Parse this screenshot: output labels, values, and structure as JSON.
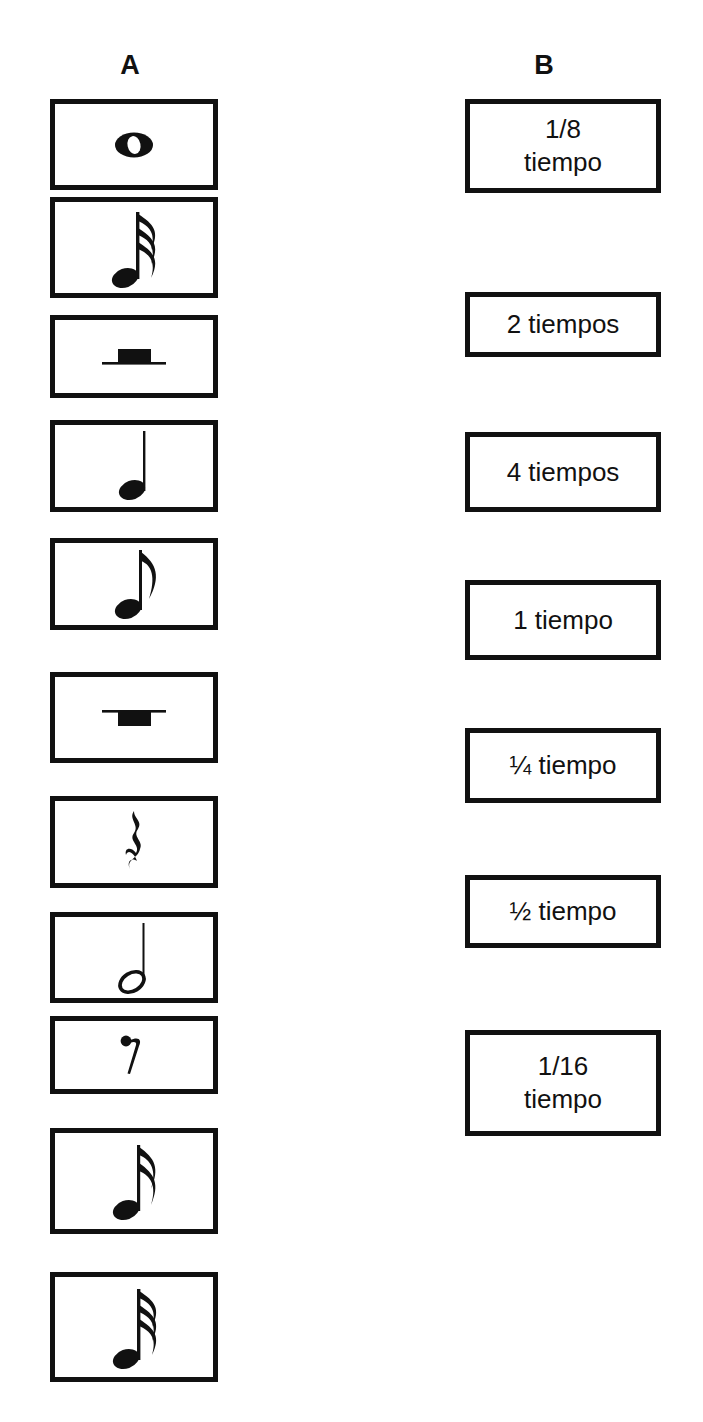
{
  "page": {
    "background_color": "#ffffff",
    "ink_color": "#111111",
    "width": 703,
    "height": 1422
  },
  "columns": {
    "a": {
      "header": "A",
      "kind": "music-symbol-cards"
    },
    "b": {
      "header": "B",
      "kind": "duration-label-cards"
    }
  },
  "column_a": {
    "items": [
      {
        "index": 1,
        "icon": "whole-note-icon",
        "symbol_name": "redonda",
        "glyph": "whole-note",
        "box": {
          "x": 50,
          "y": 99,
          "w": 168,
          "h": 91
        }
      },
      {
        "index": 2,
        "icon": "thirty-second-note-icon",
        "symbol_name": "fusa",
        "glyph": "note-3-flags",
        "box": {
          "x": 50,
          "y": 197,
          "w": 168,
          "h": 101
        }
      },
      {
        "index": 3,
        "icon": "half-rest-icon",
        "symbol_name": "silencio de blanca",
        "glyph": "half-rest",
        "box": {
          "x": 50,
          "y": 315,
          "w": 168,
          "h": 83
        }
      },
      {
        "index": 4,
        "icon": "quarter-note-icon",
        "symbol_name": "negra",
        "glyph": "quarter-note",
        "box": {
          "x": 50,
          "y": 420,
          "w": 168,
          "h": 92
        }
      },
      {
        "index": 5,
        "icon": "eighth-note-icon",
        "symbol_name": "corchea",
        "glyph": "note-1-flag",
        "box": {
          "x": 50,
          "y": 538,
          "w": 168,
          "h": 92
        }
      },
      {
        "index": 6,
        "icon": "whole-rest-icon",
        "symbol_name": "silencio de redonda",
        "glyph": "whole-rest",
        "box": {
          "x": 50,
          "y": 672,
          "w": 168,
          "h": 91
        }
      },
      {
        "index": 7,
        "icon": "quarter-rest-icon",
        "symbol_name": "silencio de negra",
        "glyph": "quarter-rest",
        "box": {
          "x": 50,
          "y": 796,
          "w": 168,
          "h": 92
        }
      },
      {
        "index": 8,
        "icon": "half-note-icon",
        "symbol_name": "blanca",
        "glyph": "half-note",
        "box": {
          "x": 50,
          "y": 912,
          "w": 168,
          "h": 91
        }
      },
      {
        "index": 9,
        "icon": "eighth-rest-icon",
        "symbol_name": "silencio de corchea",
        "glyph": "eighth-rest",
        "box": {
          "x": 50,
          "y": 1016,
          "w": 168,
          "h": 78
        }
      },
      {
        "index": 10,
        "icon": "sixteenth-note-icon",
        "symbol_name": "semicorchea",
        "glyph": "note-2-flags",
        "box": {
          "x": 50,
          "y": 1128,
          "w": 168,
          "h": 106
        }
      },
      {
        "index": 11,
        "icon": "thirty-second-note-icon",
        "symbol_name": "fusa",
        "glyph": "note-3-flags",
        "box": {
          "x": 50,
          "y": 1272,
          "w": 168,
          "h": 110
        }
      }
    ]
  },
  "column_b": {
    "items": [
      {
        "index": 1,
        "label": "1/8\ntiempo",
        "lines": [
          "1/8",
          "tiempo"
        ],
        "box": {
          "x": 465,
          "y": 99,
          "w": 196,
          "h": 94
        }
      },
      {
        "index": 2,
        "label": "2 tiempos",
        "lines": [
          "2 tiempos"
        ],
        "box": {
          "x": 465,
          "y": 292,
          "w": 196,
          "h": 65
        }
      },
      {
        "index": 3,
        "label": "4 tiempos",
        "lines": [
          "4 tiempos"
        ],
        "box": {
          "x": 465,
          "y": 432,
          "w": 196,
          "h": 80
        }
      },
      {
        "index": 4,
        "label": "1 tiempo",
        "lines": [
          "1 tiempo"
        ],
        "box": {
          "x": 465,
          "y": 580,
          "w": 196,
          "h": 80
        }
      },
      {
        "index": 5,
        "label": "¼ tiempo",
        "lines": [
          "¼ tiempo"
        ],
        "box": {
          "x": 465,
          "y": 728,
          "w": 196,
          "h": 75
        }
      },
      {
        "index": 6,
        "label": "½ tiempo",
        "lines": [
          "½ tiempo"
        ],
        "box": {
          "x": 465,
          "y": 875,
          "w": 196,
          "h": 73
        }
      },
      {
        "index": 7,
        "label": "1/16\ntiempo",
        "lines": [
          "1/16",
          "tiempo"
        ],
        "box": {
          "x": 465,
          "y": 1030,
          "w": 196,
          "h": 106
        }
      }
    ]
  }
}
